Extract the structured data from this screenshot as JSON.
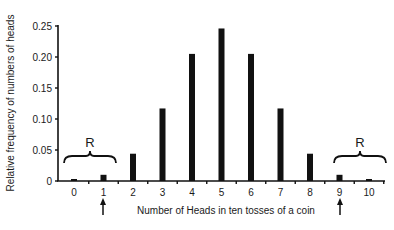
{
  "chart_data": {
    "type": "bar",
    "title": "",
    "xlabel": "Number of Heads in ten tosses of a coin",
    "ylabel": "Relative frequency of numbers of heads",
    "categories": [
      "0",
      "1",
      "2",
      "3",
      "4",
      "5",
      "6",
      "7",
      "8",
      "9",
      "10"
    ],
    "values": [
      0.001,
      0.01,
      0.044,
      0.117,
      0.205,
      0.246,
      0.205,
      0.117,
      0.044,
      0.01,
      0.001
    ],
    "ylim": [
      0,
      0.25
    ],
    "yticks": [
      "0",
      "0.05",
      "0.10",
      "0.15",
      "0.20",
      "0.25"
    ],
    "grid": false,
    "bar_color": "#111111",
    "annotations": [
      {
        "type": "brace",
        "label": "R",
        "span": [
          "0",
          "1"
        ],
        "description": "rejection region (left tail)"
      },
      {
        "type": "brace",
        "label": "R",
        "span": [
          "9",
          "10"
        ],
        "description": "rejection region (right tail)"
      },
      {
        "type": "arrow",
        "at": "1",
        "direction": "up"
      },
      {
        "type": "arrow",
        "at": "9",
        "direction": "up"
      }
    ]
  }
}
